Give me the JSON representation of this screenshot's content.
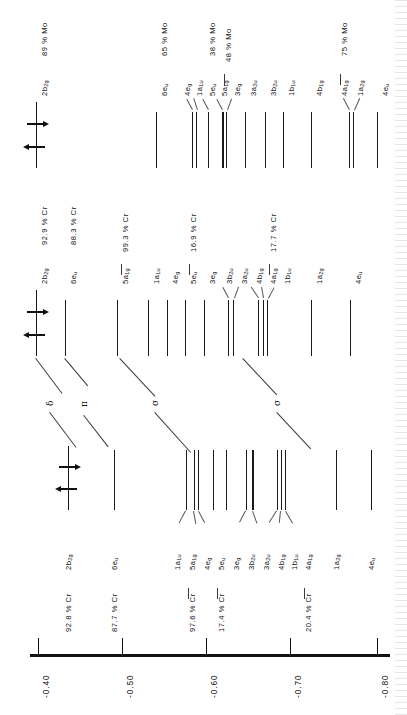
{
  "figure": {
    "type": "molecular-orbital-energy-level-diagram",
    "orientation": "rotated-90",
    "axis": {
      "label": "",
      "ticks": [
        "-0.40",
        "-0.50",
        "-0.60",
        "-0.70",
        "-0.80"
      ],
      "values": [
        -0.4,
        -0.5,
        -0.6,
        -0.7,
        -0.8
      ],
      "range": [
        -0.36,
        -0.83
      ]
    },
    "symmetry_labels_greek": [
      "δ",
      "π",
      "σ",
      "σ"
    ]
  },
  "columns": {
    "mo_top": {
      "name": "Mo",
      "levels": [
        {
          "label": "2b",
          "sub": "2g",
          "percent": "89 % Mo",
          "energy": -0.417,
          "weight": "normal"
        },
        {
          "label": "6e",
          "sub": "u",
          "percent": "65 % Mo",
          "energy": -0.571,
          "weight": "normal"
        },
        {
          "label": "4e",
          "sub": "g",
          "percent": "",
          "energy": -0.609,
          "weight": "normal"
        },
        {
          "label": "1a",
          "sub": "1u",
          "percent": "",
          "energy": -0.614,
          "weight": "normal"
        },
        {
          "label": "5e",
          "sub": "u",
          "percent": "38 % Mo",
          "energy": -0.625,
          "weight": "normal"
        },
        {
          "label": "5a",
          "sub": "1g",
          "percent": "48 % Mo",
          "energy": -0.631,
          "weight": "thick"
        },
        {
          "label": "3e",
          "sub": "g",
          "percent": "",
          "energy": -0.638,
          "weight": "normal"
        },
        {
          "label": "3a",
          "sub": "2u",
          "percent": "",
          "energy": -0.652,
          "weight": "normal"
        },
        {
          "label": "3b",
          "sub": "2u",
          "percent": "",
          "energy": -0.668,
          "weight": "normal"
        },
        {
          "label": "1b",
          "sub": "1u",
          "percent": "",
          "energy": -0.682,
          "weight": "normal"
        },
        {
          "label": "4b",
          "sub": "1g",
          "percent": "",
          "energy": -0.713,
          "weight": "normal"
        },
        {
          "label": "4a",
          "sub": "1g",
          "percent": "75 % Mo",
          "energy": -0.751,
          "weight": "normal"
        },
        {
          "label": "1a",
          "sub": "2g",
          "percent": "",
          "energy": -0.755,
          "weight": "normal"
        },
        {
          "label": "4e",
          "sub": "u",
          "percent": "",
          "energy": -0.784,
          "weight": "normal"
        }
      ]
    },
    "cr_mid": {
      "name": "Cr",
      "levels": [
        {
          "label": "2b",
          "sub": "2g",
          "percent": "92.9 % Cr",
          "energy": -0.417,
          "weight": "normal"
        },
        {
          "label": "6e",
          "sub": "u",
          "percent": "88.3 % Cr",
          "energy": -0.46,
          "weight": "normal"
        },
        {
          "label": "5a",
          "sub": "1g",
          "percent": "99.3 % Cr",
          "energy": -0.544,
          "weight": "normal"
        },
        {
          "label": "1a",
          "sub": "1u",
          "percent": "",
          "energy": -0.58,
          "weight": "normal"
        },
        {
          "label": "4e",
          "sub": "g",
          "percent": "",
          "energy": -0.594,
          "weight": "normal"
        },
        {
          "label": "5e",
          "sub": "u",
          "percent": "16.9 % Cr",
          "energy": -0.607,
          "weight": "normal"
        },
        {
          "label": "3e",
          "sub": "g",
          "percent": "",
          "energy": -0.621,
          "weight": "normal"
        },
        {
          "label": "3b",
          "sub": "2u",
          "percent": "",
          "energy": -0.635,
          "weight": "normal"
        },
        {
          "label": "3a",
          "sub": "2u",
          "percent": "",
          "energy": -0.64,
          "weight": "normal"
        },
        {
          "label": "4b",
          "sub": "1g",
          "percent": "",
          "energy": -0.672,
          "weight": "normal"
        },
        {
          "label": "4a",
          "sub": "1g",
          "percent": "17.7 % Cr",
          "energy": -0.678,
          "weight": "normal"
        },
        {
          "label": "1b",
          "sub": "1u",
          "percent": "",
          "energy": -0.683,
          "weight": "normal"
        },
        {
          "label": "1a",
          "sub": "2g",
          "percent": "",
          "energy": -0.732,
          "weight": "normal"
        },
        {
          "label": "4e",
          "sub": "u",
          "percent": "",
          "energy": -0.775,
          "weight": "normal"
        }
      ]
    },
    "cr_bottom": {
      "name": "Cr",
      "levels": [
        {
          "label": "2b",
          "sub": "2g",
          "percent": "92.8 % Cr",
          "energy": -0.417,
          "weight": "normal"
        },
        {
          "label": "6e",
          "sub": "u",
          "percent": "87.7 % Cr",
          "energy": -0.47,
          "weight": "normal"
        },
        {
          "label": "1a",
          "sub": "1u",
          "percent": "",
          "energy": -0.581,
          "weight": "normal"
        },
        {
          "label": "5a",
          "sub": "1g",
          "percent": "97.6 % Cr",
          "energy": -0.591,
          "weight": "normal"
        },
        {
          "label": "4e",
          "sub": "g",
          "percent": "",
          "energy": -0.596,
          "weight": "normal"
        },
        {
          "label": "5e",
          "sub": "u",
          "percent": "17.4 % Cr",
          "energy": -0.614,
          "weight": "normal"
        },
        {
          "label": "3e",
          "sub": "g",
          "percent": "",
          "energy": -0.629,
          "weight": "normal"
        },
        {
          "label": "3b",
          "sub": "2u",
          "percent": "",
          "energy": -0.652,
          "weight": "normal"
        },
        {
          "label": "3a",
          "sub": "2u",
          "percent": "",
          "energy": -0.659,
          "weight": "thick"
        },
        {
          "label": "4b",
          "sub": "1g",
          "percent": "",
          "energy": -0.688,
          "weight": "normal"
        },
        {
          "label": "1b",
          "sub": "1u",
          "percent": "",
          "energy": -0.693,
          "weight": "normal"
        },
        {
          "label": "4a",
          "sub": "1g",
          "percent": "20.4 % Cr",
          "energy": -0.697,
          "weight": "normal"
        },
        {
          "label": "1a",
          "sub": "2g",
          "percent": "",
          "energy": -0.755,
          "weight": "normal"
        },
        {
          "label": "4e",
          "sub": "u",
          "percent": "",
          "energy": -0.795,
          "weight": "normal"
        }
      ]
    }
  },
  "electrons": {
    "level": "2b2g",
    "spin_up_label": "spin-up-electron",
    "spin_down_label": "spin-down-electron",
    "count": 2
  }
}
